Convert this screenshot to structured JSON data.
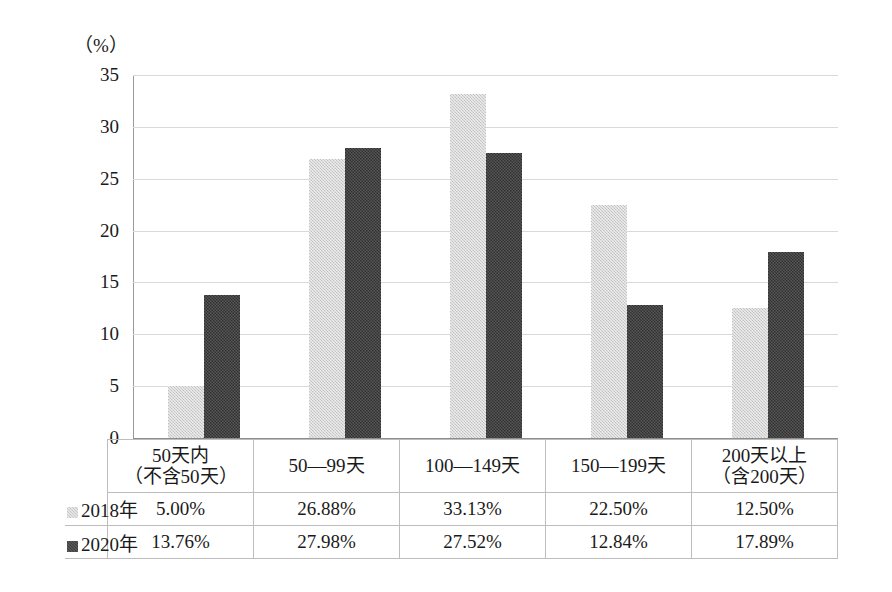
{
  "chart_data": {
    "type": "bar",
    "title": "",
    "subtitle": "",
    "xlabel": "",
    "ylabel": "",
    "unit_label": "（%）",
    "ylim": [
      0,
      35
    ],
    "ytick_labels": [
      "35",
      "30",
      "25",
      "20",
      "15",
      "10",
      "5",
      "0"
    ],
    "ytick_values": [
      35,
      30,
      25,
      20,
      15,
      10,
      5,
      0
    ],
    "grid": true,
    "legend_position": "table-row-headers",
    "categories": [
      "50天内（不含50天）",
      "50—99天",
      "100—149天",
      "150—199天",
      "200天以上（含200天）"
    ],
    "category_lines": [
      [
        "50天内",
        "（不含50天）"
      ],
      [
        "50—99天"
      ],
      [
        "100—149天"
      ],
      [
        "150—199天"
      ],
      [
        "200天以上",
        "（含200天）"
      ]
    ],
    "series": [
      {
        "name": "2018年",
        "color": "#d2d2d2",
        "values": [
          5.0,
          26.88,
          33.13,
          22.5,
          12.5
        ],
        "labels": [
          "5.00%",
          "26.88%",
          "33.13%",
          "22.50%",
          "12.50%"
        ]
      },
      {
        "name": "2020年",
        "color": "#3f3f3f",
        "values": [
          13.76,
          27.98,
          27.52,
          12.84,
          17.89
        ],
        "labels": [
          "13.76%",
          "27.98%",
          "27.52%",
          "12.84%",
          "17.89%"
        ]
      }
    ]
  }
}
